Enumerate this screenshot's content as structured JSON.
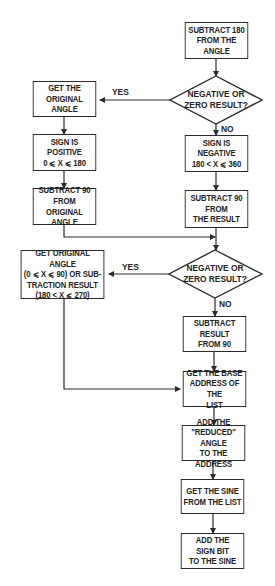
{
  "nodes": {
    "subtract180": [
      "SUBTRACT 180",
      "FROM THE ANGLE"
    ],
    "decision1": [
      "NEGATIVE OR",
      "ZERO RESULT?"
    ],
    "getOriginal": [
      "GET THE",
      "ORIGINAL ANGLE"
    ],
    "signPositive": [
      "SIGN IS POSITIVE",
      "0 ⩽ X ⩽ 180"
    ],
    "subtract90Original": [
      "SUBTRACT 90",
      "FROM",
      "ORIGINAL ANGLE"
    ],
    "signNegative": [
      "SIGN IS NEGATIVE",
      "180 < X ⩽ 360"
    ],
    "subtract90Result": [
      "SUBTRACT 90",
      "FROM",
      "THE RESULT"
    ],
    "decision2": [
      "NEGATIVE OR",
      "ZERO RESULT?"
    ],
    "getOriginalOrSub": [
      "GET ORIGINAL ANGLE",
      "(0 ⩽ X ⩽ 90) OR SUB-",
      "TRACTION RESULT",
      "(180 < X ⩽ 270)"
    ],
    "subtractFrom90": [
      "SUBTRACT",
      "RESULT",
      "FROM 90"
    ],
    "baseAddress": [
      "GET THE BASE",
      "ADDRESS OF THE",
      "LIST"
    ],
    "addReduced": [
      "ADD THE",
      "\"REDUCED\" ANGLE",
      "TO THE ADDRESS"
    ],
    "getSine": [
      "GET THE SINE",
      "FROM THE LIST"
    ],
    "addSignBit": [
      "ADD THE",
      "SIGN BIT",
      "TO THE SINE"
    ]
  },
  "labels": {
    "yes1": "YES",
    "no1": "NO",
    "yes2": "YES",
    "no2": "NO"
  },
  "colors": {
    "line": "#2a2a2a",
    "text": "#222222",
    "background": "#ffffff"
  }
}
